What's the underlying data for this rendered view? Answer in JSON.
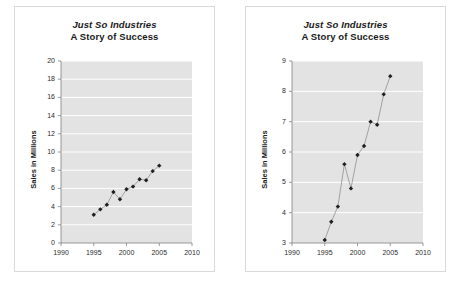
{
  "document": {
    "background_color": "#ffffff",
    "panel_border_color": "#d9d9d9"
  },
  "shared": {
    "title_line1": "Just So Industries",
    "title_line2": "A Story of Success",
    "ylabel": "Sales in Millions",
    "plot_area_color": "#e3e3e3",
    "gridline_color": "#ffffff",
    "axis_color": "#808080",
    "series_line_color": "#9a9a9a",
    "marker_color": "#1f1f1f",
    "marker_shape": "diamond"
  },
  "charts": [
    {
      "id": "chart-left",
      "panel_name": "chart-panel-left",
      "yticks": [
        "0",
        "2",
        "4",
        "6",
        "8",
        "10",
        "12",
        "14",
        "16",
        "18",
        "20"
      ],
      "xticks": [
        "1990",
        "1995",
        "2000",
        "2005",
        "2010"
      ]
    },
    {
      "id": "chart-right",
      "panel_name": "chart-panel-right",
      "yticks": [
        "3",
        "4",
        "5",
        "6",
        "7",
        "8",
        "9"
      ],
      "xticks": [
        "1990",
        "1995",
        "2000",
        "2005",
        "2010"
      ]
    }
  ],
  "chart_data": [
    {
      "type": "line",
      "title": "Just So Industries\nA Story of Success",
      "xlabel": "",
      "ylabel": "Sales in Millions",
      "x": [
        1995,
        1996,
        1997,
        1998,
        1999,
        2000,
        2001,
        2002,
        2003,
        2004,
        2005
      ],
      "values": [
        3.1,
        3.7,
        4.2,
        5.6,
        4.8,
        5.9,
        6.2,
        7.0,
        6.9,
        7.9,
        8.5
      ],
      "xlim": [
        1990,
        2010
      ],
      "ylim": [
        0,
        20
      ],
      "ytick_step": 2,
      "xtick_step": 5,
      "grid": true,
      "legend": false,
      "marker": "diamond"
    },
    {
      "type": "line",
      "title": "Just So Industries\nA Story of Success",
      "xlabel": "",
      "ylabel": "Sales in Millions",
      "x": [
        1995,
        1996,
        1997,
        1998,
        1999,
        2000,
        2001,
        2002,
        2003,
        2004,
        2005
      ],
      "values": [
        3.1,
        3.7,
        4.2,
        5.6,
        4.8,
        5.9,
        6.2,
        7.0,
        6.9,
        7.9,
        8.5
      ],
      "xlim": [
        1990,
        2010
      ],
      "ylim": [
        3,
        9
      ],
      "ytick_step": 1,
      "xtick_step": 5,
      "grid": true,
      "legend": false,
      "marker": "diamond"
    }
  ]
}
